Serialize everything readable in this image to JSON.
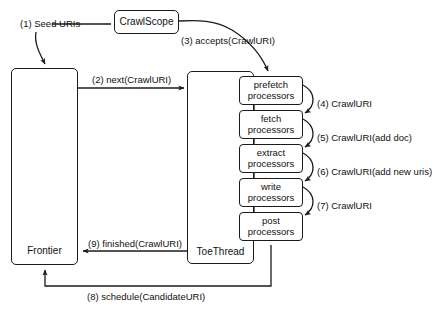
{
  "diagram": {
    "nodes": {
      "crawlscope": "CrawlScope",
      "frontier": "Frontier",
      "toethread": "ToeThread",
      "prefetch_l1": "prefetch",
      "prefetch_l2": "processors",
      "fetch_l1": "fetch",
      "fetch_l2": "processors",
      "extract_l1": "extract",
      "extract_l2": "processors",
      "write_l1": "write",
      "write_l2": "processors",
      "post_l1": "post",
      "post_l2": "processors"
    },
    "edges": {
      "e1": "(1) Seed URIs",
      "e2": "(2) next(CrawlURI)",
      "e3": "(3) accepts(CrawlURI)",
      "e4": "(4) CrawlURI",
      "e5": "(5) CrawlURI(add doc)",
      "e6": "(6) CrawlURI(add new uris)",
      "e7": "(7) CrawlURI",
      "e8": "(8) schedule(CandidateURI)",
      "e9": "(9) finished(CrawlURI)"
    },
    "colors": {
      "stroke": "#1b1b1b",
      "text": "#111111",
      "background": "#ffffff"
    }
  }
}
